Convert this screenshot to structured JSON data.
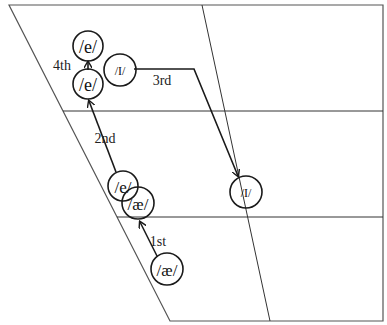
{
  "diagram": {
    "colors": {
      "line": "#1a1a1a",
      "frame": "#555555",
      "background": "#ffffff"
    },
    "vowels": [
      {
        "id": "ae-start",
        "label": "/æ/"
      },
      {
        "id": "ae-mid",
        "label": "/æ/"
      },
      {
        "id": "e-mid",
        "label": "/e/"
      },
      {
        "id": "e-lower",
        "label": "/e/"
      },
      {
        "id": "e-upper",
        "label": "/e/"
      },
      {
        "id": "I-high",
        "label": "/I/"
      },
      {
        "id": "I-central",
        "label": "/I/"
      }
    ],
    "steps": [
      {
        "id": "step-1",
        "label": "1st",
        "from": "ae-start",
        "to": "ae-mid"
      },
      {
        "id": "step-2",
        "label": "2nd",
        "from": "e-mid",
        "to": "e-lower"
      },
      {
        "id": "step-3",
        "label": "3rd",
        "from": "I-high",
        "to": "I-central"
      },
      {
        "id": "step-4",
        "label": "4th",
        "from": "e-lower",
        "to": "e-upper"
      }
    ]
  }
}
